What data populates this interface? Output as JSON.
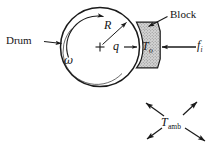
{
  "figure": {
    "domain": "diagram",
    "background_color": "#ffffff",
    "line_color": "#1a1a1a",
    "block_fill_color": "#c9c9c9",
    "width": 217,
    "height": 154
  },
  "labels": {
    "drum": "Drum",
    "block": "Block",
    "omega": "ω",
    "radius": "R",
    "heat_flux": "q",
    "block_temp_base": "T",
    "block_temp_sub": "o",
    "friction_force_base": "f",
    "friction_force_sub": "i",
    "ambient_temp_base": "T",
    "ambient_temp_sub": "amb",
    "center_marker": "+"
  },
  "geometry": {
    "drum": {
      "cx": 100,
      "cy": 47,
      "r": 39.5
    },
    "drum_inner_arc_note": "thin inner arc along lower-left rim",
    "block": {
      "top_y": 22,
      "bottom_y": 68,
      "right_x": 160,
      "left_x": 136
    },
    "ambient_arrows_center": {
      "x": 172,
      "y": 122
    }
  },
  "annotations": [
    {
      "name": "drum-leader-arrow",
      "from": [
        45,
        42
      ],
      "to": [
        62,
        44
      ],
      "direction": "right"
    },
    {
      "name": "block-leader-line",
      "from": [
        168,
        17
      ],
      "to": [
        147,
        28
      ],
      "direction": "down-left"
    },
    {
      "name": "radius-arrow",
      "from": [
        100,
        47
      ],
      "to": [
        127,
        22
      ],
      "direction": "up-right"
    },
    {
      "name": "omega-rotation-arc",
      "direction": "counter-clockwise"
    },
    {
      "name": "heat-flux-arrow",
      "from": [
        122,
        47
      ],
      "to": [
        138,
        47
      ],
      "direction": "right"
    },
    {
      "name": "friction-force-arrow",
      "from": [
        196,
        47
      ],
      "to": [
        161,
        47
      ],
      "direction": "left"
    },
    {
      "name": "ambient-arrow-up-left",
      "direction": "up-left"
    },
    {
      "name": "ambient-arrow-up-right",
      "direction": "up-right"
    },
    {
      "name": "ambient-arrow-down-left",
      "direction": "down-left"
    },
    {
      "name": "ambient-arrow-down-right",
      "direction": "down-right"
    }
  ]
}
